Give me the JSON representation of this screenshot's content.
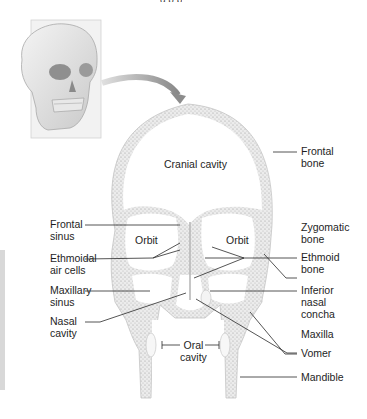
{
  "figure": {
    "inset": {
      "description": "Anterior view of skull with frontal plane indicated",
      "arrow": "points from skull to section"
    },
    "section": {
      "view": "coronal (frontal) section through skull"
    }
  },
  "labels": {
    "cranial_cavity": "Cranial cavity",
    "orbit_left": "Orbit",
    "orbit_right": "Orbit",
    "oral_cavity": "Oral\ncavity",
    "left": [
      {
        "id": "frontal-sinus",
        "text": "Frontal\nsinus"
      },
      {
        "id": "ethmoidal-air-cells",
        "text": "Ethmoidal\nair cells"
      },
      {
        "id": "maxillary-sinus",
        "text": "Maxillary\nsinus"
      },
      {
        "id": "nasal-cavity",
        "text": "Nasal\ncavity"
      }
    ],
    "right": [
      {
        "id": "frontal-bone",
        "text": "Frontal\nbone"
      },
      {
        "id": "zygomatic-bone",
        "text": "Zygomatic\nbone"
      },
      {
        "id": "ethmoid-bone",
        "text": "Ethmoid\nbone"
      },
      {
        "id": "inferior-nasal-concha",
        "text": "Inferior\nnasal\nconcha"
      },
      {
        "id": "maxilla",
        "text": "Maxilla"
      },
      {
        "id": "vomer",
        "text": "Vomer"
      },
      {
        "id": "mandible",
        "text": "Mandible"
      }
    ]
  },
  "colors": {
    "bone_fill": "#e9e9e9",
    "bone_stipple": "#9a9a9a",
    "outline": "#b5b5b5",
    "leader": "#2a2a2a",
    "text": "#1e1e1e",
    "arrow": "#8c8c8c",
    "plane": "#e6e6e6"
  }
}
